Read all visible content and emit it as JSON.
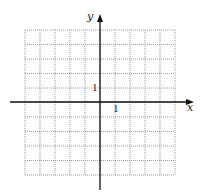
{
  "figure": {
    "type": "coordinate-grid",
    "grid": {
      "columns": 10,
      "rows": 10,
      "line_style": "dotted",
      "line_color": "#9a9a9a",
      "x_range": [
        -5,
        5
      ],
      "y_range": [
        -5,
        5
      ]
    },
    "axes": {
      "x_label": "x",
      "y_label": "y",
      "axis_color": "#111111"
    },
    "tick_labels": {
      "x_unit": "1",
      "y_unit": "1"
    }
  }
}
